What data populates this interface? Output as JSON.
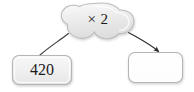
{
  "diagram": {
    "type": "function-machine",
    "operation_node": {
      "shape": "cloud-blob",
      "label": "× 2",
      "fill": "#ececec",
      "stroke": "#b9b9b9"
    },
    "input_node": {
      "shape": "rounded-rectangle",
      "label": "420",
      "fill": "#f1f1f1",
      "stroke": "#b5b5b5",
      "filled": true
    },
    "output_node": {
      "shape": "rounded-rectangle",
      "label": "",
      "fill": "#ffffff",
      "stroke": "#b5b5b5",
      "filled": false
    },
    "connectors": [
      {
        "name": "input-to-operation",
        "from": "input_node",
        "to": "operation_node",
        "arrowhead": false,
        "color": "#3a3a3a"
      },
      {
        "name": "operation-to-output",
        "from": "operation_node",
        "to": "output_node",
        "arrowhead": true,
        "color": "#2b2b2b"
      }
    ]
  }
}
